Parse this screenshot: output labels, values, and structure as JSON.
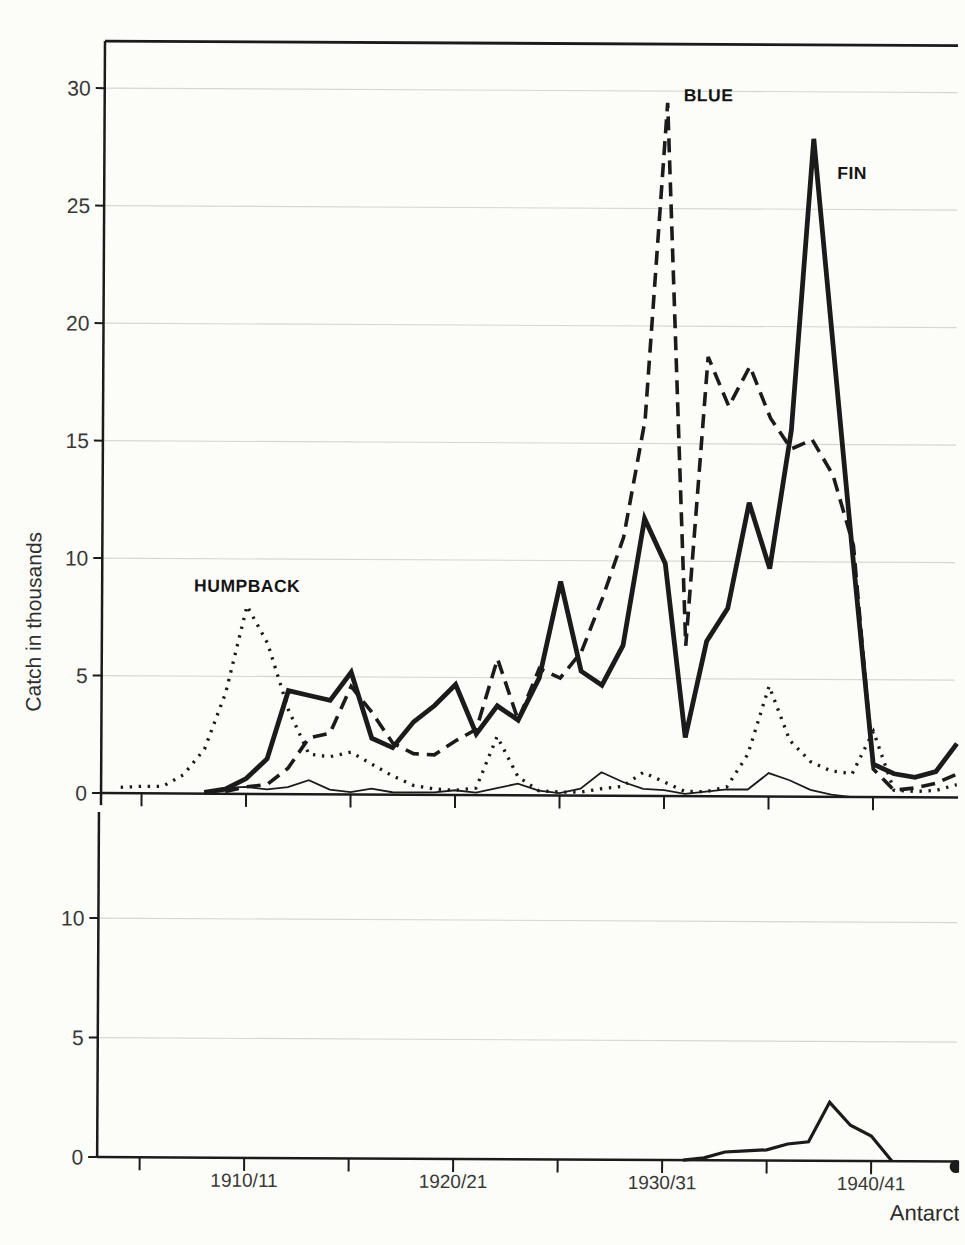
{
  "figure": {
    "y_axis_title": "Catch in thousands",
    "corner_text_partial": "Antarct",
    "series_labels": {
      "blue": "BLUE",
      "fin": "FIN",
      "humpback": "HUMPBACK"
    }
  },
  "colors": {
    "ink": "#1b1b1b",
    "paper": "#fcfcf9",
    "grid": "#d7d7d1",
    "label_text": "#383838"
  },
  "chart_data": {
    "type": "line",
    "title": "",
    "ylabel": "Catch in thousands",
    "xlabel_partial": "Antarct",
    "grid": "faint horizontal gridlines at labeled y ticks",
    "legend_position": "inline labels next to curves",
    "x_years": [
      1904,
      1905,
      1906,
      1907,
      1908,
      1909,
      1910,
      1911,
      1912,
      1913,
      1914,
      1915,
      1916,
      1917,
      1918,
      1919,
      1920,
      1921,
      1922,
      1923,
      1924,
      1925,
      1926,
      1927,
      1928,
      1929,
      1930,
      1931,
      1932,
      1933,
      1934,
      1935,
      1936,
      1937,
      1938,
      1939,
      1940,
      1941,
      1942,
      1943,
      1944
    ],
    "x_major_tick_years": [
      1910,
      1920,
      1930,
      1940
    ],
    "x_major_tick_labels": [
      "1910/11",
      "1920/21",
      "1930/31",
      "1940/41"
    ],
    "x_minor_tick_years": [
      1905,
      1915,
      1925,
      1935
    ],
    "panels": [
      {
        "name": "top-panel",
        "ylim": [
          0,
          31.8
        ],
        "yticks": [
          0,
          5,
          10,
          15,
          20,
          25,
          30
        ],
        "gridline_ticks": [
          5,
          10,
          15,
          20,
          25,
          30
        ],
        "series": [
          {
            "name": "HUMPBACK",
            "style": "dotted",
            "label": "HUMPBACK",
            "values": [
              0.25,
              0.3,
              0.3,
              0.8,
              1.9,
              4.3,
              8.0,
              6.4,
              3.6,
              1.7,
              1.6,
              1.8,
              1.3,
              0.8,
              0.4,
              0.25,
              0.2,
              0.3,
              2.5,
              0.8,
              0.2,
              0.15,
              0.15,
              0.3,
              0.4,
              1.0,
              0.6,
              0.2,
              0.2,
              0.4,
              1.8,
              4.7,
              2.4,
              1.5,
              1.1,
              1.0,
              2.8,
              0.3,
              0.25,
              0.3,
              0.55
            ]
          },
          {
            "name": "unlabeled-thin-line",
            "style": "thin-solid",
            "label": "",
            "values": [
              null,
              null,
              null,
              null,
              0.05,
              0.25,
              0.3,
              0.2,
              0.3,
              0.6,
              0.2,
              0.1,
              0.25,
              0.1,
              0.1,
              0.1,
              0.2,
              0.1,
              0.3,
              0.5,
              0.2,
              0.1,
              0.3,
              1.0,
              0.6,
              0.3,
              0.25,
              0.1,
              0.2,
              0.3,
              0.3,
              1.0,
              0.7,
              0.3,
              0.1,
              0.0,
              null,
              null,
              null,
              null,
              null
            ]
          },
          {
            "name": "BLUE",
            "style": "dashed",
            "label": "BLUE",
            "values": [
              null,
              null,
              null,
              null,
              null,
              0.1,
              0.3,
              0.4,
              1.1,
              2.4,
              2.6,
              4.6,
              3.5,
              2.2,
              1.75,
              1.7,
              2.3,
              2.8,
              5.8,
              3.2,
              5.4,
              5.0,
              6.1,
              8.4,
              11.0,
              16.0,
              29.5,
              6.4,
              18.7,
              16.6,
              18.3,
              16.1,
              14.8,
              15.2,
              13.7,
              10.7,
              1.2,
              0.3,
              0.4,
              0.6,
              1.0
            ]
          },
          {
            "name": "FIN",
            "style": "thick-solid",
            "label": "FIN",
            "values": [
              null,
              null,
              null,
              null,
              0.05,
              0.2,
              0.65,
              1.5,
              4.4,
              4.2,
              4.0,
              5.2,
              2.4,
              2.0,
              3.1,
              3.8,
              4.7,
              2.6,
              3.8,
              3.2,
              5.0,
              9.1,
              5.3,
              4.7,
              6.4,
              11.8,
              9.9,
              2.5,
              6.6,
              8.0,
              12.5,
              9.7,
              15.6,
              28.0,
              19.0,
              10.0,
              1.4,
              1.0,
              0.85,
              1.1,
              2.3
            ]
          }
        ]
      },
      {
        "name": "bottom-panel",
        "ylim": [
          0,
          12.3
        ],
        "yticks": [
          0,
          5,
          10
        ],
        "gridline_ticks": [
          5,
          10
        ],
        "series": [
          {
            "name": "unlabeled-bottom-series",
            "style": "solid",
            "label": "",
            "values": [
              null,
              null,
              null,
              null,
              null,
              null,
              null,
              null,
              null,
              null,
              null,
              null,
              null,
              null,
              null,
              null,
              null,
              null,
              null,
              null,
              null,
              null,
              null,
              null,
              null,
              null,
              null,
              0.0,
              0.1,
              0.35,
              0.4,
              0.45,
              0.7,
              0.8,
              2.45,
              1.5,
              1.05,
              0.0,
              null,
              null,
              null
            ]
          }
        ]
      }
    ]
  }
}
